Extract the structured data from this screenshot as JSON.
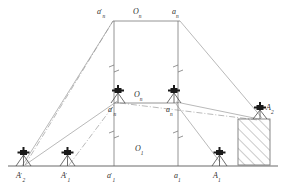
{
  "figure": {
    "type": "engineering-survey-diagram",
    "canvas": {
      "width": 286,
      "height": 194
    },
    "colors": {
      "line": "#7a7a7a",
      "ground": "#6b6b6b",
      "instrument": "#1a1a1a",
      "hatch": "#8a8a8a",
      "text": "#2e2e2e",
      "background": "#ffffff"
    },
    "levels": [
      {
        "name": "top-level",
        "origin_label": "O",
        "origin_sub": "n"
      },
      {
        "name": "middle-level",
        "origin_label": "O",
        "origin_sub": "n"
      },
      {
        "name": "ground-level",
        "origin_label": "O",
        "origin_sub": "1"
      }
    ],
    "labels": [
      {
        "id": "top-left-point",
        "base": "a",
        "prime": true,
        "sub": "n",
        "x": 97,
        "y": 8
      },
      {
        "id": "top-origin",
        "base": "O",
        "prime": false,
        "sub": "n",
        "x": 133,
        "y": 8
      },
      {
        "id": "top-right-point",
        "base": "a",
        "prime": false,
        "sub": "n",
        "x": 172,
        "y": 8
      },
      {
        "id": "mid-origin",
        "base": "O",
        "prime": false,
        "sub": "n",
        "x": 134,
        "y": 91
      },
      {
        "id": "mid-left-point",
        "base": "a",
        "prime": true,
        "sub": "n",
        "x": 108,
        "y": 107
      },
      {
        "id": "mid-right-point",
        "base": "a",
        "prime": false,
        "sub": "n",
        "x": 166,
        "y": 107
      },
      {
        "id": "station-A2-elev",
        "base": "A",
        "prime": false,
        "sub": "2",
        "x": 266,
        "y": 106
      },
      {
        "id": "ground-origin",
        "base": "O",
        "prime": false,
        "sub": "1",
        "x": 135,
        "y": 146
      },
      {
        "id": "ground-A2prime",
        "base": "A",
        "prime": true,
        "sub": "2",
        "x": 16,
        "y": 176
      },
      {
        "id": "ground-A1prime",
        "base": "A",
        "prime": true,
        "sub": "1",
        "x": 61,
        "y": 176
      },
      {
        "id": "ground-a1prime",
        "base": "a",
        "prime": true,
        "sub": "1",
        "x": 107,
        "y": 176
      },
      {
        "id": "ground-a1",
        "base": "a",
        "prime": false,
        "sub": "1",
        "x": 175,
        "y": 176
      },
      {
        "id": "ground-A1",
        "base": "A",
        "prime": false,
        "sub": "1",
        "x": 214,
        "y": 176
      }
    ],
    "instruments": [
      {
        "id": "theodolite-A2prime",
        "x": 23,
        "y": 164,
        "scale": 1.0
      },
      {
        "id": "theodolite-A1prime",
        "x": 67,
        "y": 164,
        "scale": 1.0
      },
      {
        "id": "theodolite-A1",
        "x": 219,
        "y": 164,
        "scale": 1.0
      },
      {
        "id": "theodolite-mid-left",
        "x": 118,
        "y": 104,
        "scale": 1.0
      },
      {
        "id": "theodolite-mid-right",
        "x": 174,
        "y": 104,
        "scale": 1.0
      },
      {
        "id": "theodolite-A2",
        "x": 260,
        "y": 119,
        "scale": 1.0
      }
    ],
    "hatched_block": {
      "id": "building-column",
      "x": 238,
      "y": 119,
      "width": 32,
      "height": 46,
      "hatch_direction": "lower-left-to-upper-right"
    },
    "break_marks": [
      {
        "id": "break-left-upper",
        "x": 114,
        "y": 68
      },
      {
        "id": "break-right-upper",
        "x": 178,
        "y": 68
      },
      {
        "id": "break-left-lower",
        "x": 114,
        "y": 134
      },
      {
        "id": "break-right-lower",
        "x": 178,
        "y": 134
      }
    ],
    "ground_line": {
      "x1": 8,
      "y1": 166,
      "x2": 278,
      "y2": 166
    }
  }
}
